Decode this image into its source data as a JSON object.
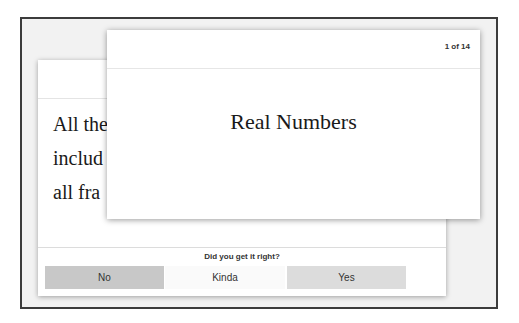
{
  "back_card": {
    "definition_lines": [
      "All the",
      "includ",
      "all fra"
    ],
    "prompt": "Did you get it right?",
    "buttons": {
      "no": "No",
      "kinda": "Kinda",
      "yes": "Yes"
    }
  },
  "front_card": {
    "counter": "1 of 14",
    "term": "Real Numbers"
  },
  "colors": {
    "frame_border": "#3c3c3c",
    "frame_bg": "#f2f2f2",
    "no_button": "#c8c8c8",
    "kinda_button": "#fafafa",
    "yes_button": "#dcdcdc"
  }
}
